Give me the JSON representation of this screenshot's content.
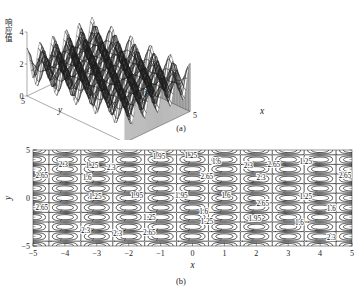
{
  "figure": {
    "panels": [
      {
        "id": "a",
        "caption": "(a)",
        "type": "surface3d",
        "zaxis": {
          "label": "响应值",
          "ticks": [
            "4",
            "2",
            "0"
          ],
          "range": [
            0,
            4
          ]
        },
        "xaxis": {
          "label": "x",
          "ticks": [
            "-5",
            "0",
            "5"
          ],
          "range": [
            -5,
            5
          ]
        },
        "yaxis": {
          "label": "y",
          "ticks": [
            "5",
            "0",
            "-5"
          ],
          "range": [
            -5,
            5
          ]
        }
      },
      {
        "id": "b",
        "caption": "(b)",
        "type": "contour",
        "xaxis": {
          "label": "x",
          "ticks": [
            "-5",
            "-4",
            "-3",
            "-2",
            "-1",
            "0",
            "1",
            "2",
            "3",
            "4",
            "5"
          ],
          "range": [
            -5,
            5
          ]
        },
        "yaxis": {
          "label": "y",
          "ticks": [
            "5",
            "0",
            "-5"
          ],
          "range": [
            -5,
            5
          ]
        },
        "contour_levels": [
          "1.25",
          "1.6",
          "1.95",
          "2.3",
          "2.65"
        ]
      }
    ]
  },
  "chart_data": [
    {
      "type": "surface",
      "panel": "a",
      "title": "",
      "xlabel": "x",
      "ylabel": "y",
      "zlabel": "响应值",
      "xlim": [
        -5,
        5
      ],
      "ylim": [
        -5,
        5
      ],
      "zlim": [
        0,
        4
      ],
      "xticks": [
        -5,
        0,
        5
      ],
      "yticks": [
        -5,
        0,
        5
      ],
      "zticks": [
        0,
        2,
        4
      ],
      "grid": false,
      "legend": "none",
      "mesh": "wireframe-black",
      "description": "Doubly-periodic sinusoidal response surface with regularly spaced peaks and valleys over the square domain x,y in [-5,5]; response value oscillates between roughly 0.9 and 3.0 with base skirt drawn down to z=0.",
      "surface_model": {
        "form": "z = 1.95 + 1.05*cos(pi*x)*cos(pi*y)",
        "period_x": 2.0,
        "period_y": 2.0,
        "zmin_approx": 0.9,
        "zmax_approx": 3.0
      }
    },
    {
      "type": "contour",
      "panel": "b",
      "title": "",
      "xlabel": "x",
      "ylabel": "y",
      "xlim": [
        -5,
        5
      ],
      "ylim": [
        -5,
        5
      ],
      "xticks": [
        -5,
        -4,
        -3,
        -2,
        -1,
        0,
        1,
        2,
        3,
        4,
        5
      ],
      "yticks": [
        -5,
        0,
        5
      ],
      "grid": false,
      "legend": "none",
      "levels": [
        1.25,
        1.6,
        1.95,
        2.3,
        2.65
      ],
      "inline_labels": true,
      "description": "Contour map of the same doubly-periodic sinusoidal response surface; closed concentric rings around each extremum, labelled inline with level values 1.25, 1.6, 1.95, 2.3 and 2.65.",
      "surface_model": {
        "form": "z = 1.95 + 1.05*cos(pi*x)*cos(pi*y)",
        "period_x": 2.0,
        "period_y": 2.0
      }
    }
  ]
}
